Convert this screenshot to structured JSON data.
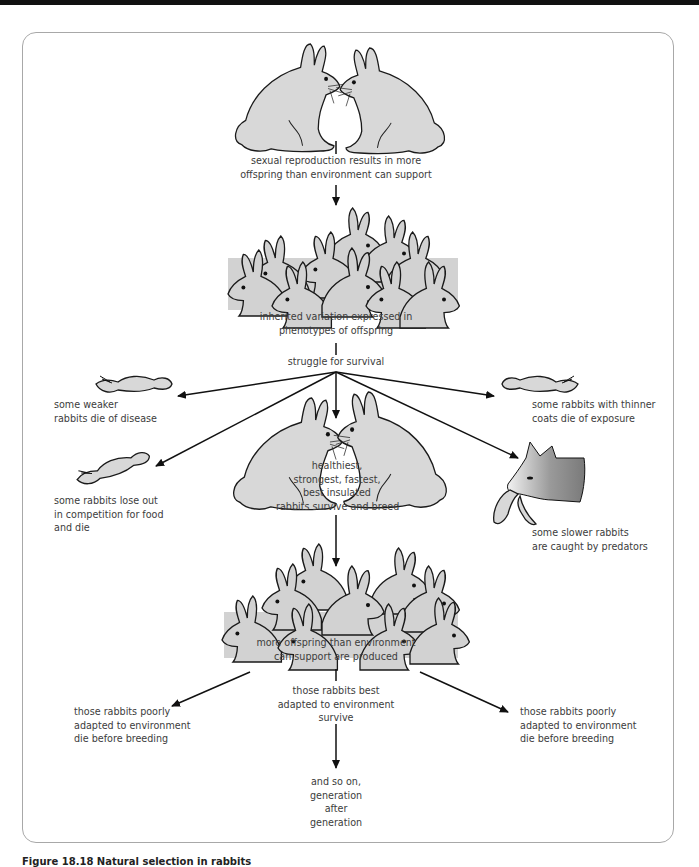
{
  "figure": {
    "caption": "Figure 18.18 Natural selection in rabbits"
  },
  "nodes": {
    "parents": "sexual reproduction results in more offspring than environment can support",
    "parents_l1": "sexual reproduction results in more",
    "parents_l2": "offspring than environment can support",
    "offspring_l1": "inherited variation expressed in",
    "offspring_l2": "phenotypes of offspring",
    "struggle": "struggle for survival",
    "disease_l1": "some weaker",
    "disease_l2": "rabbits die of disease",
    "exposure_l1": "some rabbits with thinner",
    "exposure_l2": "coats die of exposure",
    "competition_l1": "some rabbits lose out",
    "competition_l2": "in competition for food",
    "competition_l3": "and die",
    "predators_l1": "some slower rabbits",
    "predators_l2": "are caught by predators",
    "survivors_l1": "healthiest,",
    "survivors_l2": "strongest, fastest,",
    "survivors_l3": "best insulated",
    "survivors_l4": "rabbits survive and breed",
    "next_gen_l1": "more offspring than environment",
    "next_gen_l2": "can support are produced",
    "best_l1": "those rabbits best",
    "best_l2": "adapted to environment",
    "best_l3": "survive",
    "poor_left_l1": "those rabbits poorly",
    "poor_left_l2": "adapted to environment",
    "poor_left_l3": "die before breeding",
    "poor_right_l1": "those rabbits poorly",
    "poor_right_l2": "adapted to environment",
    "poor_right_l3": "die before breeding",
    "end_l1": "and so on,",
    "end_l2": "generation",
    "end_l3": "after",
    "end_l4": "generation"
  },
  "colors": {
    "frame_border": "#a8a8a8",
    "rabbit_fill": "#d8d8d8",
    "line": "#111111",
    "text": "#3c3c3c"
  }
}
